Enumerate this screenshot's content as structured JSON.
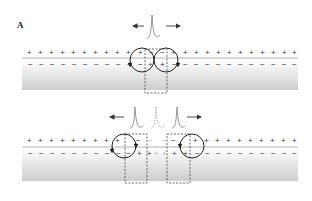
{
  "figure": {
    "panel_label": "A",
    "colors": {
      "membrane_line": "#a0a0a0",
      "charge": "#333333",
      "faint_charge": "#b0b0b0",
      "axon_gradient_top": "#ffffff",
      "axon_gradient_bottom": "#cfcfcf",
      "circuit": "#222222",
      "spike": "#888888",
      "dashed_box": "#444444"
    },
    "top_panel": {
      "description": "Action potential at a single site with local current loops spreading in both directions",
      "outside_charge": "+",
      "inside_charge": "-",
      "arrows": [
        "left",
        "right"
      ],
      "spikes": 1
    },
    "bottom_panel": {
      "description": "Two action potentials propagating away from the original site in opposite directions",
      "outside_charge": "+",
      "inside_charge": "-",
      "arrows": [
        "left",
        "right"
      ],
      "spikes": 3,
      "middle_spike_style": "dashed"
    }
  }
}
